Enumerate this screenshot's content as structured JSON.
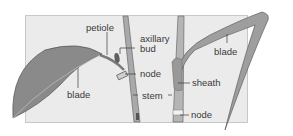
{
  "diagram": {
    "labels": {
      "petiole": "petiole",
      "axillary_1": "axillary",
      "axillary_2": "bud",
      "node_left": "node",
      "blade_left": "blade",
      "stem": "stem",
      "sheath": "sheath",
      "blade_right": "blade",
      "node_right": "node"
    },
    "colors": {
      "panel": "#ebebeb",
      "leaf": "#8a8a8a",
      "stem": "#a9a9a9",
      "text": "#3a3a3a"
    }
  }
}
